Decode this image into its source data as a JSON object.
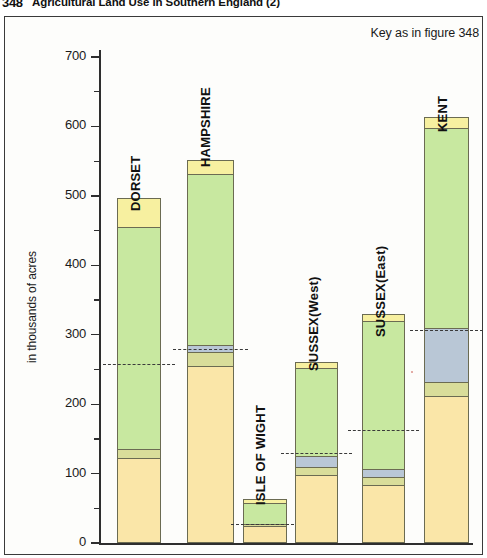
{
  "title": {
    "number": "348",
    "text": "Agricultural Land Use in Southern England  (2)"
  },
  "key_note": "Key as in figure 348",
  "axis": {
    "y_title": "in thousands of acres",
    "y_ticks_major": [
      "0",
      "100",
      "200",
      "300",
      "400",
      "500",
      "600",
      "700"
    ],
    "y_min": 0,
    "y_max": 700,
    "y_major_step": 100,
    "y_minor_step": 50
  },
  "colors": {
    "crops_tan": "#fae6a8",
    "rough_olive": "#d9dd9a",
    "woodland_blue": "#b9c7d6",
    "grass_green": "#c8e8a0",
    "other_yellow": "#f7f0a0",
    "outline": "#6b6b52",
    "frame": "#3a3a3a",
    "dashed_marker": "#3a3a3a",
    "background": "#fdfdfb"
  },
  "chart_data": {
    "type": "bar",
    "title": "Agricultural Land Use in Southern England  (2)",
    "xlabel": "",
    "ylabel": "in thousands of acres",
    "ylim": [
      0,
      700
    ],
    "stacked": true,
    "grid": false,
    "legend": "Key as in figure 348",
    "categories": [
      "DORSET",
      "HAMPSHIRE",
      "ISLE OF WIGHT",
      "SUSSEX(West)",
      "SUSSEX(East)",
      "KENT"
    ],
    "series": [
      {
        "name": "crops-tan",
        "color": "#fae6a8",
        "values": [
          122,
          255,
          25,
          98,
          84,
          211
        ]
      },
      {
        "name": "rough-olive",
        "color": "#d9dd9a",
        "values": [
          13,
          20,
          3,
          12,
          11,
          21
        ]
      },
      {
        "name": "woodland-blue",
        "color": "#b9c7d6",
        "values": [
          0,
          10,
          0,
          12,
          10,
          78
        ]
      },
      {
        "name": "grass-green",
        "color": "#c8e8a0",
        "values": [
          320,
          240,
          29,
          127,
          213,
          287
        ]
      },
      {
        "name": "other-yellow",
        "color": "#f7f0a0",
        "values": [
          42,
          19,
          6,
          9,
          10,
          16
        ]
      }
    ],
    "totals": [
      497,
      551,
      63,
      261,
      330,
      613
    ],
    "marker_lines": {
      "label": "dashed reference marker",
      "values": [
        258,
        280,
        27,
        130,
        163,
        307
      ]
    }
  },
  "bars": [
    {
      "name": "dorset",
      "label": "DORSET",
      "total": 497,
      "marker": 258,
      "segments": [
        {
          "name": "crops-tan",
          "from": 0,
          "to": 122,
          "color": "#fae6a8"
        },
        {
          "name": "rough-olive",
          "from": 122,
          "to": 135,
          "color": "#d9dd9a"
        },
        {
          "name": "grass-green",
          "from": 135,
          "to": 455,
          "color": "#c8e8a0"
        },
        {
          "name": "other-yellow",
          "from": 455,
          "to": 497,
          "color": "#f7f0a0"
        }
      ]
    },
    {
      "name": "hampshire",
      "label": "HAMPSHIRE",
      "total": 551,
      "marker": 280,
      "segments": [
        {
          "name": "crops-tan",
          "from": 0,
          "to": 255,
          "color": "#fae6a8"
        },
        {
          "name": "rough-olive",
          "from": 255,
          "to": 275,
          "color": "#d9dd9a"
        },
        {
          "name": "woodland-blue",
          "from": 275,
          "to": 285,
          "color": "#b9c7d6"
        },
        {
          "name": "grass-green",
          "from": 285,
          "to": 532,
          "color": "#c8e8a0"
        },
        {
          "name": "other-yellow",
          "from": 532,
          "to": 551,
          "color": "#f7f0a0"
        }
      ]
    },
    {
      "name": "isle-of-wight",
      "label": "ISLE OF WIGHT",
      "total": 63,
      "marker": 27,
      "segments": [
        {
          "name": "crops-tan",
          "from": 0,
          "to": 25,
          "color": "#fae6a8"
        },
        {
          "name": "rough-olive",
          "from": 25,
          "to": 28,
          "color": "#d9dd9a"
        },
        {
          "name": "grass-green",
          "from": 28,
          "to": 57,
          "color": "#c8e8a0"
        },
        {
          "name": "other-yellow",
          "from": 57,
          "to": 63,
          "color": "#f7f0a0"
        }
      ]
    },
    {
      "name": "sussex-west",
      "label": "SUSSEX(West)",
      "total": 261,
      "marker": 130,
      "segments": [
        {
          "name": "crops-tan",
          "from": 0,
          "to": 98,
          "color": "#fae6a8"
        },
        {
          "name": "rough-olive",
          "from": 98,
          "to": 110,
          "color": "#d9dd9a"
        },
        {
          "name": "woodland-blue",
          "from": 110,
          "to": 125,
          "color": "#b9c7d6"
        },
        {
          "name": "grass-green",
          "from": 125,
          "to": 252,
          "color": "#c8e8a0"
        },
        {
          "name": "other-yellow",
          "from": 252,
          "to": 261,
          "color": "#f7f0a0"
        }
      ]
    },
    {
      "name": "sussex-east",
      "label": "SUSSEX(East)",
      "total": 330,
      "marker": 163,
      "segments": [
        {
          "name": "crops-tan",
          "from": 0,
          "to": 84,
          "color": "#fae6a8"
        },
        {
          "name": "rough-olive",
          "from": 84,
          "to": 95,
          "color": "#d9dd9a"
        },
        {
          "name": "woodland-blue",
          "from": 95,
          "to": 107,
          "color": "#b9c7d6"
        },
        {
          "name": "grass-green",
          "from": 107,
          "to": 320,
          "color": "#c8e8a0"
        },
        {
          "name": "other-yellow",
          "from": 320,
          "to": 330,
          "color": "#f7f0a0"
        }
      ]
    },
    {
      "name": "kent",
      "label": "KENT",
      "total": 613,
      "marker": 307,
      "segments": [
        {
          "name": "crops-tan",
          "from": 0,
          "to": 211,
          "color": "#fae6a8"
        },
        {
          "name": "rough-olive",
          "from": 211,
          "to": 232,
          "color": "#d9dd9a"
        },
        {
          "name": "woodland-blue",
          "from": 232,
          "to": 310,
          "color": "#b9c7d6"
        },
        {
          "name": "grass-green",
          "from": 310,
          "to": 597,
          "color": "#c8e8a0"
        },
        {
          "name": "other-yellow",
          "from": 597,
          "to": 613,
          "color": "#f7f0a0"
        }
      ]
    }
  ]
}
